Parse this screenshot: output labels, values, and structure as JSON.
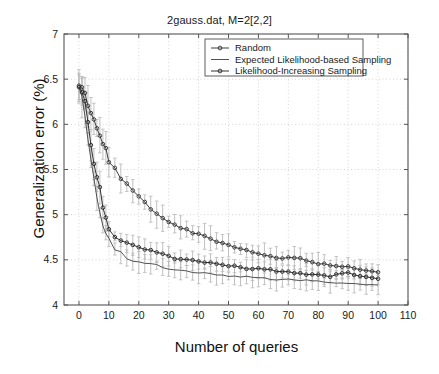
{
  "chart_data": {
    "type": "line",
    "title": "2gauss.dat, M=2[2,2]",
    "xlabel": "Number of queries",
    "ylabel": "Generalization error (%)",
    "xlim": [
      -5,
      110
    ],
    "ylim": [
      4,
      7
    ],
    "xticks": [
      0,
      10,
      20,
      30,
      40,
      50,
      60,
      70,
      80,
      90,
      100,
      110
    ],
    "yticks": [
      4,
      4.5,
      5,
      5.5,
      6,
      6.5,
      7
    ],
    "grid": true,
    "legend_position": "top-center",
    "series": [
      {
        "name": "Random",
        "color": "#333333",
        "marker": "circle",
        "x": [
          0,
          1,
          2,
          3,
          4,
          5,
          6,
          7,
          8,
          9,
          10,
          12,
          14,
          16,
          18,
          20,
          22,
          24,
          26,
          28,
          30,
          32,
          34,
          36,
          38,
          40,
          42,
          44,
          46,
          48,
          50,
          52,
          54,
          56,
          58,
          60,
          62,
          64,
          66,
          68,
          70,
          72,
          74,
          76,
          78,
          80,
          82,
          84,
          86,
          88,
          90,
          92,
          94,
          96,
          98,
          100
        ],
        "values": [
          6.42,
          6.4,
          6.34,
          6.2,
          6.12,
          6.06,
          5.96,
          5.88,
          5.78,
          5.74,
          5.58,
          5.52,
          5.4,
          5.34,
          5.26,
          5.2,
          5.14,
          5.06,
          5.0,
          4.96,
          4.92,
          4.9,
          4.86,
          4.84,
          4.8,
          4.78,
          4.76,
          4.74,
          4.71,
          4.69,
          4.66,
          4.64,
          4.62,
          4.6,
          4.58,
          4.56,
          4.55,
          4.54,
          4.53,
          4.52,
          4.52,
          4.52,
          4.51,
          4.5,
          4.48,
          4.46,
          4.45,
          4.44,
          4.44,
          4.43,
          4.42,
          4.41,
          4.4,
          4.39,
          4.38,
          4.37
        ]
      },
      {
        "name": "Expected Likelihood-based Sampling",
        "color": "#4a4a4a",
        "marker": "none",
        "x": [
          0,
          1,
          2,
          3,
          4,
          5,
          6,
          7,
          8,
          9,
          10,
          12,
          14,
          16,
          18,
          20,
          22,
          24,
          26,
          28,
          30,
          32,
          34,
          36,
          38,
          40,
          42,
          44,
          46,
          48,
          50,
          52,
          54,
          56,
          58,
          60,
          62,
          64,
          66,
          68,
          70,
          72,
          74,
          76,
          78,
          80,
          82,
          84,
          86,
          88,
          90,
          92,
          94,
          96,
          98,
          100
        ],
        "values": [
          6.4,
          6.3,
          6.1,
          5.84,
          5.62,
          5.4,
          5.18,
          5.02,
          4.88,
          4.8,
          4.74,
          4.62,
          4.58,
          4.52,
          4.48,
          4.47,
          4.46,
          4.45,
          4.44,
          4.42,
          4.4,
          4.39,
          4.38,
          4.37,
          4.36,
          4.36,
          4.35,
          4.34,
          4.34,
          4.33,
          4.32,
          4.32,
          4.31,
          4.31,
          4.3,
          4.3,
          4.29,
          4.29,
          4.28,
          4.28,
          4.28,
          4.27,
          4.27,
          4.27,
          4.26,
          4.26,
          4.25,
          4.25,
          4.25,
          4.24,
          4.24,
          4.24,
          4.23,
          4.23,
          4.22,
          4.22
        ]
      },
      {
        "name": "Likelihood-Increasing Sampling",
        "color": "#262626",
        "marker": "circle",
        "x": [
          0,
          1,
          2,
          3,
          4,
          5,
          6,
          7,
          8,
          9,
          10,
          12,
          14,
          16,
          18,
          20,
          22,
          24,
          26,
          28,
          30,
          32,
          34,
          36,
          38,
          40,
          42,
          44,
          46,
          48,
          50,
          52,
          54,
          56,
          58,
          60,
          62,
          64,
          66,
          68,
          70,
          72,
          74,
          76,
          78,
          80,
          82,
          84,
          86,
          88,
          90,
          92,
          94,
          96,
          98,
          100
        ],
        "values": [
          6.42,
          6.36,
          6.25,
          6.02,
          5.76,
          5.56,
          5.42,
          5.3,
          5.08,
          4.96,
          4.84,
          4.76,
          4.72,
          4.68,
          4.66,
          4.64,
          4.62,
          4.6,
          4.58,
          4.56,
          4.54,
          4.52,
          4.51,
          4.5,
          4.49,
          4.48,
          4.47,
          4.46,
          4.45,
          4.45,
          4.44,
          4.43,
          4.42,
          4.41,
          4.4,
          4.4,
          4.39,
          4.39,
          4.38,
          4.37,
          4.36,
          4.35,
          4.35,
          4.34,
          4.33,
          4.33,
          4.32,
          4.32,
          4.33,
          4.34,
          4.35,
          4.34,
          4.33,
          4.32,
          4.31,
          4.3
        ]
      }
    ],
    "errorbars": {
      "color": "#b9b9b9",
      "note": "light gray vertical error bars on every series point"
    }
  },
  "legend": {
    "items": [
      {
        "label": "Random",
        "marker": "circle-line"
      },
      {
        "label": "Expected Likelihood-based Sampling",
        "marker": "plain-line"
      },
      {
        "label": "Likelihood-Increasing Sampling",
        "marker": "circle-line"
      }
    ]
  },
  "colors": {
    "axis": "#555555",
    "grid": "#cccccc",
    "background": "#ffffff",
    "text": "#1a1a1a"
  }
}
